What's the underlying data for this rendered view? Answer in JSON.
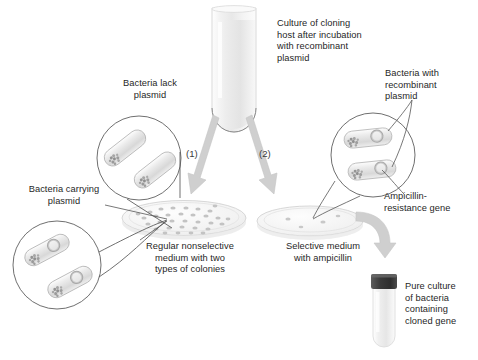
{
  "figure": {
    "domain": "biology-diagram",
    "title_text": "",
    "background_color": "#ffffff",
    "text_color": "#1f1f1f",
    "arrow_color": "#c9c9c9",
    "line_color": "#6e6e6e"
  },
  "labels": {
    "culture_tube": "Culture of cloning\nhost after incubation\nwith recombinant\nplasmid",
    "bacteria_lack_plasmid": "Bacteria lack\nplasmid",
    "bacteria_with_recombinant_plasmid": "Bacteria with\nrecombinant\nplasmid",
    "bacteria_carrying_plasmid": "Bacteria carrying\nplasmid",
    "nonselective_medium": "Regular nonselective\nmedium with two\ntypes of colonies",
    "selective_medium": "Selective medium\nwith ampicillin",
    "ampicillin_resistance_gene": "Ampicillin-\nresistance gene",
    "pure_culture": "Pure culture\nof bacteria\ncontaining\ncloned gene"
  },
  "steps": {
    "step_one": "(1)",
    "step_two": "(2)"
  },
  "icons": {
    "test_tube": "test-tube-icon",
    "petri_dish_left": "petri-dish-icon",
    "petri_dish_right": "petri-dish-icon",
    "vial": "culture-vial-icon",
    "arrow_one": "arrow-down-left-icon",
    "arrow_two": "arrow-down-right-icon",
    "arrow_curved": "arrow-curved-icon",
    "bacteria_circle_top_left": "bacteria-magnifier-icon",
    "bacteria_circle_bottom_left": "bacteria-magnifier-icon",
    "bacteria_circle_right": "bacteria-magnifier-icon"
  },
  "counts": {
    "nonselective_colonies": 32,
    "selective_colonies": 4,
    "bacteria_per_circle": 2
  }
}
